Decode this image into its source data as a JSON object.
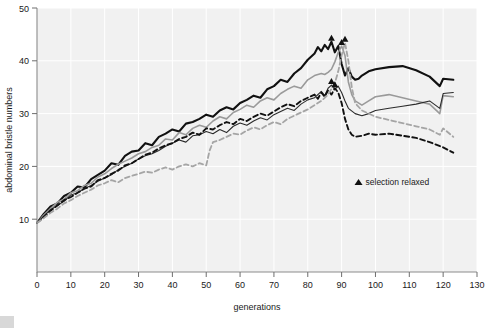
{
  "chart_data": {
    "type": "line",
    "title": "",
    "xlabel": "generations",
    "ylabel": "abdominal bristle numbers",
    "xlim": [
      0,
      130
    ],
    "ylim": [
      0,
      50
    ],
    "xticks": [
      0,
      10,
      20,
      30,
      40,
      50,
      60,
      70,
      80,
      90,
      100,
      110,
      120,
      130
    ],
    "yticks": [
      10,
      20,
      30,
      40,
      50
    ],
    "grid": true,
    "legend_position": "inside-center-right",
    "annotations": [
      {
        "marker": "triangle",
        "label": "selection relaxed",
        "x": 95,
        "y": 16.5
      }
    ],
    "series": [
      {
        "name": "line-1-thick-black-solid",
        "color": "#111111",
        "style": "solid",
        "width": 2.1,
        "points": [
          [
            0,
            9.3
          ],
          [
            2,
            11.0
          ],
          [
            4,
            12.4
          ],
          [
            6,
            13.0
          ],
          [
            8,
            14.4
          ],
          [
            10,
            15.0
          ],
          [
            12,
            16.2
          ],
          [
            14,
            16.0
          ],
          [
            16,
            17.6
          ],
          [
            18,
            18.4
          ],
          [
            20,
            19.2
          ],
          [
            22,
            20.6
          ],
          [
            24,
            20.3
          ],
          [
            26,
            22.0
          ],
          [
            28,
            22.8
          ],
          [
            30,
            23.0
          ],
          [
            32,
            24.4
          ],
          [
            34,
            24.0
          ],
          [
            36,
            25.6
          ],
          [
            38,
            26.2
          ],
          [
            40,
            27.0
          ],
          [
            42,
            26.6
          ],
          [
            44,
            28.1
          ],
          [
            46,
            28.4
          ],
          [
            48,
            29.0
          ],
          [
            50,
            29.8
          ],
          [
            52,
            29.4
          ],
          [
            54,
            30.6
          ],
          [
            56,
            31.2
          ],
          [
            58,
            30.8
          ],
          [
            60,
            32.0
          ],
          [
            62,
            32.6
          ],
          [
            64,
            33.4
          ],
          [
            66,
            33.0
          ],
          [
            68,
            34.6
          ],
          [
            70,
            35.2
          ],
          [
            72,
            36.4
          ],
          [
            74,
            36.0
          ],
          [
            76,
            37.6
          ],
          [
            78,
            38.6
          ],
          [
            80,
            40.2
          ],
          [
            82,
            41.4
          ],
          [
            83,
            42.6
          ],
          [
            84,
            41.8
          ],
          [
            85,
            43.0
          ],
          [
            86,
            42.2
          ],
          [
            87,
            43.6
          ],
          [
            88,
            41.6
          ],
          [
            89,
            42.8
          ],
          [
            90,
            39.4
          ],
          [
            91,
            37.2
          ],
          [
            92,
            38.6
          ],
          [
            93,
            37.0
          ],
          [
            94,
            36.4
          ],
          [
            95,
            36.6
          ],
          [
            96,
            37.2
          ],
          [
            98,
            38.0
          ],
          [
            100,
            38.4
          ],
          [
            104,
            38.8
          ],
          [
            108,
            39.0
          ],
          [
            112,
            38.2
          ],
          [
            116,
            37.0
          ],
          [
            119,
            35.2
          ],
          [
            120,
            36.6
          ],
          [
            123,
            36.4
          ]
        ]
      },
      {
        "name": "line-2-gray-solid",
        "color": "#9a9a9a",
        "style": "solid",
        "width": 1.6,
        "points": [
          [
            0,
            9.3
          ],
          [
            2,
            10.8
          ],
          [
            4,
            12.0
          ],
          [
            6,
            13.2
          ],
          [
            8,
            13.8
          ],
          [
            10,
            15.0
          ],
          [
            12,
            15.4
          ],
          [
            14,
            16.4
          ],
          [
            16,
            16.8
          ],
          [
            18,
            18.0
          ],
          [
            20,
            18.6
          ],
          [
            22,
            19.6
          ],
          [
            24,
            20.4
          ],
          [
            26,
            21.0
          ],
          [
            28,
            21.6
          ],
          [
            30,
            22.4
          ],
          [
            32,
            22.8
          ],
          [
            34,
            23.6
          ],
          [
            36,
            24.0
          ],
          [
            38,
            25.2
          ],
          [
            40,
            25.0
          ],
          [
            42,
            26.4
          ],
          [
            44,
            26.0
          ],
          [
            46,
            27.2
          ],
          [
            48,
            27.8
          ],
          [
            50,
            27.4
          ],
          [
            52,
            28.6
          ],
          [
            54,
            29.4
          ],
          [
            56,
            29.0
          ],
          [
            58,
            30.2
          ],
          [
            60,
            30.8
          ],
          [
            62,
            31.6
          ],
          [
            64,
            31.2
          ],
          [
            66,
            32.4
          ],
          [
            68,
            33.0
          ],
          [
            70,
            32.6
          ],
          [
            72,
            33.8
          ],
          [
            74,
            34.6
          ],
          [
            76,
            35.2
          ],
          [
            78,
            34.8
          ],
          [
            80,
            36.4
          ],
          [
            82,
            37.2
          ],
          [
            84,
            37.6
          ],
          [
            85,
            37.4
          ],
          [
            86,
            37.8
          ],
          [
            87,
            38.4
          ],
          [
            88,
            39.8
          ],
          [
            89,
            41.6
          ],
          [
            90,
            42.8
          ],
          [
            91,
            41.0
          ],
          [
            92,
            36.0
          ],
          [
            93,
            33.6
          ],
          [
            94,
            32.4
          ],
          [
            96,
            31.6
          ],
          [
            98,
            32.4
          ],
          [
            100,
            33.2
          ],
          [
            104,
            33.6
          ],
          [
            108,
            33.0
          ],
          [
            112,
            32.4
          ],
          [
            116,
            31.8
          ],
          [
            119,
            30.0
          ],
          [
            120,
            33.4
          ],
          [
            123,
            33.2
          ]
        ]
      },
      {
        "name": "line-3-thin-black-solid",
        "color": "#2b2b2b",
        "style": "solid",
        "width": 1.1,
        "points": [
          [
            0,
            9.3
          ],
          [
            2,
            10.6
          ],
          [
            4,
            11.8
          ],
          [
            6,
            12.6
          ],
          [
            8,
            13.4
          ],
          [
            10,
            14.6
          ],
          [
            12,
            15.0
          ],
          [
            14,
            15.8
          ],
          [
            16,
            16.4
          ],
          [
            18,
            17.2
          ],
          [
            20,
            17.8
          ],
          [
            22,
            18.4
          ],
          [
            24,
            19.4
          ],
          [
            26,
            20.0
          ],
          [
            28,
            20.6
          ],
          [
            30,
            21.4
          ],
          [
            32,
            22.0
          ],
          [
            34,
            22.4
          ],
          [
            36,
            23.0
          ],
          [
            38,
            23.8
          ],
          [
            40,
            24.4
          ],
          [
            42,
            25.0
          ],
          [
            44,
            24.6
          ],
          [
            46,
            25.8
          ],
          [
            48,
            26.0
          ],
          [
            50,
            26.6
          ],
          [
            52,
            26.2
          ],
          [
            54,
            27.0
          ],
          [
            56,
            26.4
          ],
          [
            58,
            27.6
          ],
          [
            60,
            28.2
          ],
          [
            62,
            27.8
          ],
          [
            64,
            28.6
          ],
          [
            66,
            29.2
          ],
          [
            68,
            28.8
          ],
          [
            70,
            29.8
          ],
          [
            72,
            30.4
          ],
          [
            74,
            31.0
          ],
          [
            76,
            30.6
          ],
          [
            78,
            31.8
          ],
          [
            80,
            32.6
          ],
          [
            82,
            33.0
          ],
          [
            84,
            34.2
          ],
          [
            85,
            33.4
          ],
          [
            86,
            34.8
          ],
          [
            87,
            35.4
          ],
          [
            88,
            34.6
          ],
          [
            89,
            35.2
          ],
          [
            90,
            34.0
          ],
          [
            91,
            32.4
          ],
          [
            92,
            31.0
          ],
          [
            94,
            30.0
          ],
          [
            96,
            29.6
          ],
          [
            98,
            30.0
          ],
          [
            100,
            30.6
          ],
          [
            104,
            31.0
          ],
          [
            108,
            31.4
          ],
          [
            112,
            31.8
          ],
          [
            116,
            32.4
          ],
          [
            119,
            31.0
          ],
          [
            120,
            33.8
          ],
          [
            123,
            34.0
          ]
        ]
      },
      {
        "name": "line-4-black-dashed",
        "color": "#111111",
        "style": "dashed",
        "width": 1.9,
        "points": [
          [
            0,
            9.3
          ],
          [
            2,
            10.4
          ],
          [
            4,
            11.6
          ],
          [
            6,
            12.6
          ],
          [
            8,
            13.6
          ],
          [
            10,
            14.2
          ],
          [
            12,
            15.0
          ],
          [
            14,
            15.8
          ],
          [
            16,
            16.2
          ],
          [
            18,
            17.4
          ],
          [
            20,
            17.8
          ],
          [
            22,
            18.6
          ],
          [
            24,
            19.2
          ],
          [
            26,
            20.2
          ],
          [
            28,
            20.6
          ],
          [
            30,
            21.4
          ],
          [
            32,
            22.2
          ],
          [
            34,
            22.6
          ],
          [
            36,
            23.4
          ],
          [
            38,
            24.0
          ],
          [
            40,
            24.4
          ],
          [
            42,
            25.2
          ],
          [
            44,
            25.6
          ],
          [
            46,
            26.4
          ],
          [
            48,
            26.0
          ],
          [
            50,
            27.2
          ],
          [
            52,
            27.0
          ],
          [
            54,
            27.8
          ],
          [
            56,
            28.4
          ],
          [
            58,
            28.0
          ],
          [
            60,
            29.0
          ],
          [
            62,
            28.6
          ],
          [
            64,
            29.4
          ],
          [
            66,
            30.0
          ],
          [
            68,
            29.6
          ],
          [
            70,
            30.4
          ],
          [
            72,
            31.2
          ],
          [
            74,
            31.8
          ],
          [
            76,
            31.4
          ],
          [
            78,
            32.4
          ],
          [
            80,
            33.0
          ],
          [
            82,
            33.6
          ],
          [
            83,
            32.8
          ],
          [
            84,
            34.0
          ],
          [
            85,
            33.2
          ],
          [
            86,
            34.4
          ],
          [
            87,
            33.6
          ],
          [
            88,
            34.8
          ],
          [
            89,
            34.0
          ],
          [
            90,
            32.0
          ],
          [
            91,
            29.0
          ],
          [
            92,
            27.0
          ],
          [
            93,
            26.0
          ],
          [
            94,
            25.6
          ],
          [
            96,
            25.8
          ],
          [
            98,
            26.2
          ],
          [
            100,
            26.0
          ],
          [
            104,
            26.2
          ],
          [
            108,
            25.8
          ],
          [
            112,
            25.4
          ],
          [
            116,
            24.6
          ],
          [
            120,
            23.6
          ],
          [
            123,
            22.6
          ]
        ]
      },
      {
        "name": "line-5-gray-dashed",
        "color": "#a5a5a5",
        "style": "dashed",
        "width": 1.8,
        "points": [
          [
            0,
            9.3
          ],
          [
            2,
            10.2
          ],
          [
            4,
            11.2
          ],
          [
            6,
            12.0
          ],
          [
            8,
            13.0
          ],
          [
            10,
            13.6
          ],
          [
            12,
            14.4
          ],
          [
            14,
            15.0
          ],
          [
            16,
            15.6
          ],
          [
            18,
            16.4
          ],
          [
            20,
            16.8
          ],
          [
            22,
            17.4
          ],
          [
            24,
            17.0
          ],
          [
            26,
            17.8
          ],
          [
            28,
            18.2
          ],
          [
            30,
            18.6
          ],
          [
            32,
            19.0
          ],
          [
            34,
            18.8
          ],
          [
            36,
            19.4
          ],
          [
            38,
            19.8
          ],
          [
            40,
            19.4
          ],
          [
            42,
            20.0
          ],
          [
            44,
            20.4
          ],
          [
            46,
            20.0
          ],
          [
            48,
            20.6
          ],
          [
            50,
            20.2
          ],
          [
            51,
            23.0
          ],
          [
            52,
            24.6
          ],
          [
            54,
            25.0
          ],
          [
            56,
            25.6
          ],
          [
            58,
            26.2
          ],
          [
            60,
            26.0
          ],
          [
            62,
            26.8
          ],
          [
            64,
            27.4
          ],
          [
            66,
            27.0
          ],
          [
            68,
            27.8
          ],
          [
            70,
            28.4
          ],
          [
            72,
            28.0
          ],
          [
            74,
            29.0
          ],
          [
            76,
            29.6
          ],
          [
            78,
            30.2
          ],
          [
            80,
            30.8
          ],
          [
            82,
            31.6
          ],
          [
            84,
            32.4
          ],
          [
            86,
            33.6
          ],
          [
            88,
            35.8
          ],
          [
            89,
            38.0
          ],
          [
            90,
            41.0
          ],
          [
            91,
            43.4
          ],
          [
            92,
            40.0
          ],
          [
            93,
            35.0
          ],
          [
            94,
            32.0
          ],
          [
            96,
            30.6
          ],
          [
            98,
            30.0
          ],
          [
            100,
            29.4
          ],
          [
            104,
            28.8
          ],
          [
            108,
            28.2
          ],
          [
            112,
            27.6
          ],
          [
            116,
            27.0
          ],
          [
            119,
            26.0
          ],
          [
            120,
            27.2
          ],
          [
            123,
            25.6
          ]
        ]
      }
    ]
  }
}
